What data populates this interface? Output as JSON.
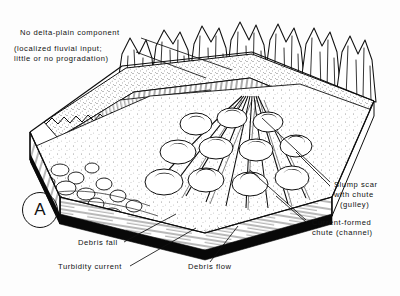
{
  "figure": {
    "panel_letter": "A",
    "type": "geologic-block-diagram",
    "background_color": "#fdfdfd",
    "ink_color": "#111111"
  },
  "annotations": {
    "top_left": {
      "line1": "No delta-plain component",
      "line2": "(localized fluvial input;",
      "line3": "little or no progradation)"
    },
    "right": {
      "slump": {
        "line1": "Slump scar",
        "line2": "with chute",
        "line3": "(gulley)"
      },
      "chute": {
        "line1": "Current-formed",
        "line2": "chute (channel)"
      }
    },
    "bottom": {
      "debris_fall": "Debris fall",
      "turbidity_current": "Turbidity current",
      "debris_flow": "Debris flow"
    }
  },
  "scene_elements": {
    "mountains": "mountain-range-backdrop",
    "fault_scarp": "fault-scarp-face",
    "shelf_terrace": "stippled-shelf-terrace",
    "apron": "slope-apron-lobes",
    "basin_floor": "basin-floor",
    "block_front_face": "stratigraphic-front-face",
    "block_left_face": "stratigraphic-left-face",
    "basal_band": "black-basal-band"
  }
}
